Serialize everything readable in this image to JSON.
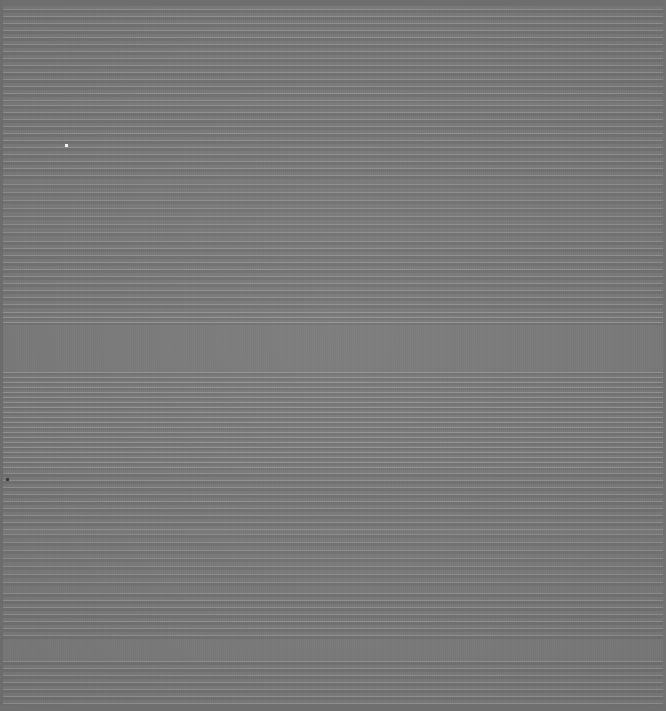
{
  "capture": {
    "title": "Screen Capture",
    "description": "Blank gray screen with horizontal scanline interference pattern",
    "width": 666,
    "height": 711,
    "readable_text": "",
    "visible_controls": "none",
    "colors": {
      "field": "#79797a",
      "gap_band": "#7a7a7b",
      "top_edge": "#6e6e6f",
      "left_edge": "#6c6c6d",
      "right_edge": "#717172",
      "bottom_edge": "#6f6f70",
      "stripe_light": "#9a9a9b",
      "stripe_dark": "#6b6b6c",
      "white_dot": "#f2f2f2",
      "dark_dot": "#3a3a3b"
    }
  },
  "edges": {
    "top": {
      "y": 0,
      "height": 6
    },
    "left": {
      "x": 0,
      "width": 3
    },
    "right": {
      "x": 663,
      "width": 3
    },
    "bottom": {
      "y": 705,
      "height": 6
    }
  },
  "bands": [
    {
      "name": "band-top-fine",
      "y": 6,
      "height": 96,
      "period": 7,
      "style": "p7"
    },
    {
      "name": "band-upper-mid",
      "y": 102,
      "height": 78,
      "period": 7,
      "style": "p7"
    },
    {
      "name": "band-upper-wide",
      "y": 180,
      "height": 58,
      "period": 8,
      "style": "p8"
    },
    {
      "name": "band-center-fine",
      "y": 238,
      "height": 72,
      "period": 7,
      "style": "p7"
    },
    {
      "name": "band-pre-gap",
      "y": 310,
      "height": 15,
      "period": 5,
      "style": "p5"
    },
    {
      "name": "band-gap-upper",
      "y": 325,
      "height": 45,
      "period": 0,
      "style": "flat"
    },
    {
      "name": "band-post-gap",
      "y": 370,
      "height": 25,
      "period": 5,
      "style": "p5"
    },
    {
      "name": "band-dense",
      "y": 395,
      "height": 75,
      "period": 5,
      "style": "p5"
    },
    {
      "name": "band-lower-fine",
      "y": 470,
      "height": 60,
      "period": 7,
      "style": "p7"
    },
    {
      "name": "band-lower-wide",
      "y": 530,
      "height": 60,
      "period": 8,
      "style": "p8"
    },
    {
      "name": "band-lower-mid",
      "y": 590,
      "height": 50,
      "period": 7,
      "style": "p7"
    },
    {
      "name": "band-gap-lower",
      "y": 640,
      "height": 18,
      "period": 0,
      "style": "flat"
    },
    {
      "name": "band-bottom-fine",
      "y": 658,
      "height": 47,
      "period": 7,
      "style": "p7"
    }
  ],
  "artifacts": [
    {
      "name": "white-pixel-artifact",
      "x": 65,
      "y": 144,
      "size": 3,
      "color": "#f2f2f2"
    },
    {
      "name": "dark-pixel-artifact",
      "x": 6,
      "y": 478,
      "size": 3,
      "color": "#3a3a3b"
    }
  ]
}
